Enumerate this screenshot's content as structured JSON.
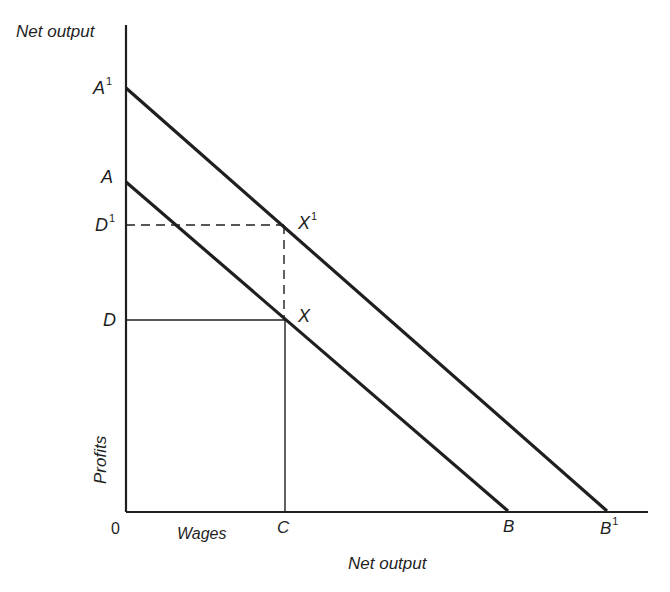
{
  "figure": {
    "y_axis_label": "Net output",
    "y_axis_side_label": "Profits",
    "x_axis_label": "Net output",
    "x_axis_segment_label": "Wages",
    "origin_label": "0",
    "points": {
      "A1": {
        "label": "A",
        "sup": "1"
      },
      "A": {
        "label": "A",
        "sup": ""
      },
      "D1": {
        "label": "D",
        "sup": "1"
      },
      "D": {
        "label": "D",
        "sup": ""
      },
      "X1": {
        "label": "X",
        "sup": "1"
      },
      "X": {
        "label": "X",
        "sup": ""
      },
      "C": {
        "label": "C",
        "sup": ""
      },
      "B": {
        "label": "B",
        "sup": ""
      },
      "B1": {
        "label": "B",
        "sup": "1"
      }
    },
    "colors": {
      "ink": "#1f1f1f",
      "background": "#ffffff"
    }
  },
  "lines": [
    {
      "name": "A-B",
      "from": "A",
      "to": "B",
      "style": "solid"
    },
    {
      "name": "A1-B1",
      "from": "A1",
      "to": "B1",
      "style": "solid"
    },
    {
      "name": "D-X",
      "from": "D",
      "to": "X",
      "style": "solid-thin"
    },
    {
      "name": "X-C",
      "from": "X",
      "to": "C",
      "style": "solid-thin"
    },
    {
      "name": "D1-X1",
      "from": "D1",
      "to": "X1",
      "style": "dashed"
    },
    {
      "name": "X1-X",
      "from": "X1",
      "to": "X",
      "style": "dashed"
    }
  ]
}
